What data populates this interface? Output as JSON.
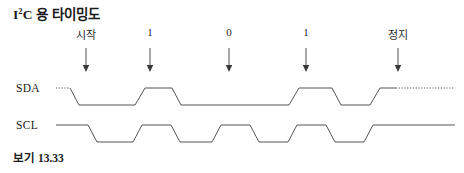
{
  "figure": {
    "title_main": "C 용 타이밍도",
    "title_sup": "2",
    "title_lead": "I",
    "caption": "보기 13.33",
    "line_color": "#555555",
    "arrow_color": "#3a3a3a",
    "background": "#ffffff"
  },
  "signals": [
    {
      "name": "SDA",
      "label": "SDA"
    },
    {
      "name": "SCL",
      "label": "SCL"
    }
  ],
  "annotations": [
    {
      "label": "시작",
      "x": 86
    },
    {
      "label": "1",
      "x": 150
    },
    {
      "label": "0",
      "x": 229
    },
    {
      "label": "1",
      "x": 306
    },
    {
      "label": "정지",
      "x": 398
    }
  ],
  "chart_data": {
    "type": "line",
    "xlabel": "",
    "ylabel": "",
    "series": [
      {
        "name": "SDA",
        "high_level": 88,
        "low_level": 105,
        "dotted_lead_in": [
          56,
          70
        ],
        "dotted_lead_out": [
          396,
          455
        ],
        "points": [
          [
            70,
            88
          ],
          [
            79,
            105
          ],
          [
            135,
            105
          ],
          [
            145,
            88
          ],
          [
            172,
            88
          ],
          [
            181,
            105
          ],
          [
            289,
            105
          ],
          [
            299,
            88
          ],
          [
            332,
            88
          ],
          [
            341,
            105
          ],
          [
            370,
            105
          ],
          [
            380,
            88
          ],
          [
            396,
            88
          ]
        ]
      },
      {
        "name": "SCL",
        "high_level": 125,
        "low_level": 142,
        "points": [
          [
            56,
            125
          ],
          [
            88,
            125
          ],
          [
            97,
            142
          ],
          [
            133,
            142
          ],
          [
            142,
            125
          ],
          [
            171,
            125
          ],
          [
            180,
            142
          ],
          [
            212,
            142
          ],
          [
            221,
            125
          ],
          [
            250,
            125
          ],
          [
            259,
            142
          ],
          [
            288,
            142
          ],
          [
            297,
            125
          ],
          [
            326,
            125
          ],
          [
            335,
            142
          ],
          [
            364,
            142
          ],
          [
            373,
            125
          ],
          [
            455,
            125
          ]
        ]
      }
    ],
    "legend": [],
    "grid": false
  }
}
